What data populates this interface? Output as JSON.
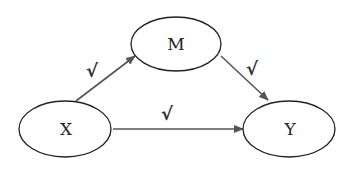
{
  "diagram": {
    "type": "mediation-path-diagram",
    "nodes": [
      {
        "id": "M",
        "label": "M"
      },
      {
        "id": "X",
        "label": "X"
      },
      {
        "id": "Y",
        "label": "Y"
      }
    ],
    "edges": [
      {
        "from": "X",
        "to": "M",
        "mark": "√"
      },
      {
        "from": "M",
        "to": "Y",
        "mark": "√"
      },
      {
        "from": "X",
        "to": "Y",
        "mark": "√"
      }
    ],
    "colors": {
      "stroke": "#222222",
      "arrow": "#555555"
    }
  }
}
